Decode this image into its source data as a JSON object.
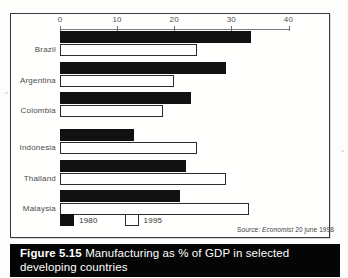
{
  "caption": {
    "figure_number": "Figure 5.15",
    "text": "Manufacturing as % of GDP in selected developing countries"
  },
  "source": {
    "prefix": "Source:",
    "publication": "Economist",
    "date": "20 june 1998"
  },
  "legend": {
    "position": "bottom-left",
    "items": [
      {
        "label": "1980",
        "swatch": "black"
      },
      {
        "label": "1995",
        "swatch": "white"
      }
    ]
  },
  "axis": {
    "ticks": [
      "0",
      "10",
      "20",
      "30",
      "40"
    ],
    "min": 0,
    "max": 40,
    "position": "top"
  },
  "chart_data": {
    "type": "bar",
    "orientation": "horizontal",
    "title": "Manufacturing as % of GDP in selected developing countries",
    "xlabel": "",
    "ylabel": "",
    "xlim": [
      0,
      40
    ],
    "grid": false,
    "legend_position": "bottom-left",
    "categories": [
      "Brazil",
      "Argentina",
      "Colombia",
      "Indonesia",
      "Thailand",
      "Malaysia"
    ],
    "series": [
      {
        "name": "1980",
        "color": "#111111",
        "values": [
          33.5,
          29,
          23,
          13,
          22,
          21
        ]
      },
      {
        "name": "1995",
        "color": "#ffffff",
        "values": [
          24,
          20,
          18,
          24,
          29,
          33
        ]
      }
    ],
    "annotations": [
      "Source: Economist 20 june 1998"
    ]
  },
  "colors": {
    "series_1980": "#111111",
    "series_1995": "#ffffff",
    "caption_bar": "#050505",
    "caption_text": "#ffffff",
    "frame": "#3a3a3a"
  }
}
